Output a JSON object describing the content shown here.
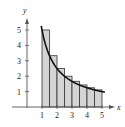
{
  "chart_data": {
    "type": "bar",
    "title": "",
    "xlabel": "x",
    "ylabel": "y",
    "xlim": [
      0,
      5.6
    ],
    "ylim": [
      0,
      5.6
    ],
    "x_ticks": [
      "1",
      "2",
      "3",
      "4",
      "5"
    ],
    "y_ticks": [
      "1",
      "2",
      "3",
      "4",
      "5"
    ],
    "grid": false,
    "legend": null,
    "rectangles": {
      "width": 0.5,
      "x_left": [
        1,
        1.5,
        2,
        2.5,
        3,
        3.5,
        4,
        4.5
      ],
      "heights": [
        5,
        3.33,
        2.5,
        2,
        1.67,
        1.43,
        1.25,
        1.11
      ]
    },
    "curve": {
      "name": "y = 5/x",
      "x": [
        0.95,
        1,
        1.5,
        2,
        2.5,
        3,
        3.5,
        4,
        4.5,
        5,
        5.2
      ],
      "y": [
        5.26,
        5,
        3.33,
        2.5,
        2,
        1.67,
        1.43,
        1.25,
        1.11,
        1,
        0.96
      ]
    },
    "colors": {
      "fill": "#d4d4d4",
      "stroke": "#333333",
      "curve": "#111111"
    }
  }
}
